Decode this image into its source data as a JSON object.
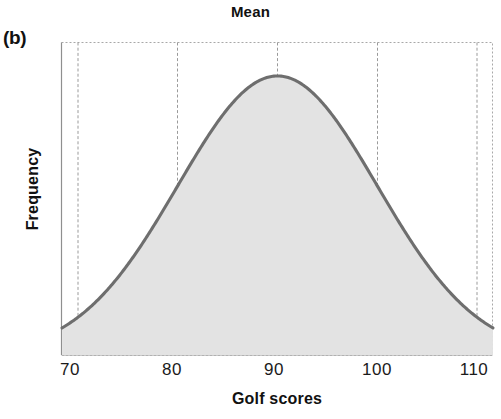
{
  "figure": {
    "panel_label": "(b)",
    "title": "Mean",
    "x_axis_title": "Golf scores",
    "y_axis_title": "Frequency"
  },
  "colors": {
    "curve_stroke": "#6e6e6e",
    "curve_fill": "#e3e3e3",
    "gridline": "#9a9a9a",
    "axis": "#8a8a8a",
    "text": "#111111",
    "background": "#ffffff"
  },
  "chart_data": {
    "type": "area",
    "title": "Mean",
    "xlabel": "Golf scores",
    "ylabel": "Frequency",
    "xlim": [
      66,
      114
    ],
    "ylim": [
      0,
      1.12
    ],
    "grid": true,
    "legend": false,
    "xticks": [
      70,
      80,
      90,
      100,
      110
    ],
    "xtick_labels": [
      "70",
      "80",
      "90",
      "100",
      "110"
    ],
    "yticks": [],
    "ytick_labels": [],
    "annotations": [
      {
        "text": "Mean",
        "x": 90,
        "position": "top-center",
        "note": "title marks the mean of the distribution at x = 90"
      },
      {
        "text": "(b)",
        "position": "outside-top-left",
        "note": "panel identifier"
      }
    ],
    "distribution": {
      "shape": "normal",
      "mean": 90,
      "std_dev": 10,
      "peak_x": 90,
      "peak_y": 1.0,
      "symmetric": true
    },
    "series": [
      {
        "name": "Golf score frequency",
        "fill": "#e3e3e3",
        "stroke": "#6e6e6e",
        "x": [
          66,
          68,
          70,
          72,
          74,
          76,
          78,
          80,
          82,
          84,
          86,
          88,
          90,
          92,
          94,
          96,
          98,
          100,
          102,
          104,
          106,
          108,
          110,
          112,
          114
        ],
        "y": [
          0.011,
          0.022,
          0.044,
          0.083,
          0.146,
          0.237,
          0.36,
          0.607,
          0.726,
          0.835,
          0.923,
          0.98,
          1.0,
          0.98,
          0.923,
          0.835,
          0.726,
          0.607,
          0.487,
          0.36,
          0.237,
          0.146,
          0.083,
          0.022,
          0.011
        ]
      }
    ]
  }
}
